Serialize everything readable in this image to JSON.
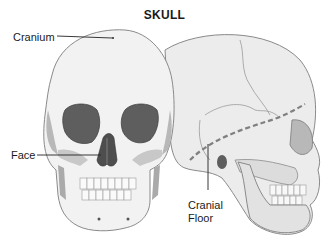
{
  "diagram": {
    "title": "SKULL",
    "labels": {
      "cranium": "Cranium",
      "face": "Face",
      "cranial_floor_line1": "Cranial",
      "cranial_floor_line2": "Floor"
    },
    "colors": {
      "bone_light": "#f2f2f2",
      "bone_mid": "#d8d8d8",
      "bone_shadow": "#a8a8a8",
      "cavity": "#5e5e5e",
      "outline": "#7a7a7a",
      "leader": "#222222",
      "dashed_line": "#808080"
    }
  }
}
